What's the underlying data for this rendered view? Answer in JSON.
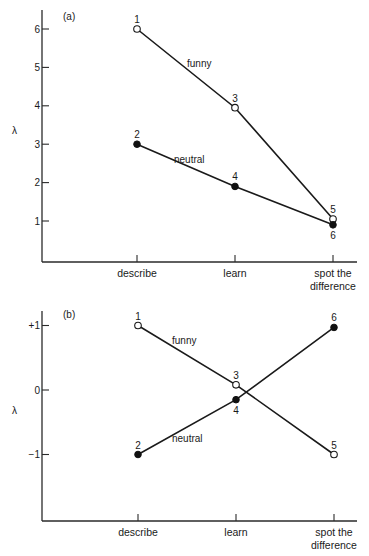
{
  "chart_data": [
    {
      "panel": "(a)",
      "type": "line",
      "xlabel": "",
      "ylabel": "λ",
      "categories": [
        "describe",
        "learn",
        "spot the difference"
      ],
      "category_lines": [
        [
          "describe"
        ],
        [
          "learn"
        ],
        [
          "spot the",
          "difference"
        ]
      ],
      "yticks": [
        1,
        2,
        3,
        4,
        5,
        6
      ],
      "ytick_labels": [
        "1",
        "2",
        "3",
        "4",
        "5",
        "6"
      ],
      "ylim": [
        0,
        6.5
      ],
      "grid": false,
      "series": [
        {
          "name": "funny",
          "marker": "open-circle",
          "values": [
            6.0,
            3.95,
            1.05
          ],
          "point_labels": [
            "1",
            "3",
            "5"
          ]
        },
        {
          "name": "neutral",
          "marker": "filled-circle",
          "values": [
            3.0,
            1.9,
            0.9
          ],
          "point_labels": [
            "2",
            "4",
            "6"
          ]
        }
      ]
    },
    {
      "panel": "(b)",
      "type": "line",
      "xlabel": "",
      "ylabel": "λ",
      "categories": [
        "describe",
        "learn",
        "spot the difference"
      ],
      "category_lines": [
        [
          "describe"
        ],
        [
          "learn"
        ],
        [
          "spot the",
          "difference"
        ]
      ],
      "yticks": [
        1,
        0,
        -1
      ],
      "ytick_labels": [
        "+1",
        "0",
        "−1"
      ],
      "ylim": [
        -2.0,
        1.25
      ],
      "grid": false,
      "series": [
        {
          "name": "funny",
          "marker": "open-circle",
          "values": [
            1.0,
            0.08,
            -1.0
          ],
          "point_labels": [
            "1",
            "3",
            "5"
          ]
        },
        {
          "name": "neutral",
          "marker": "filled-circle",
          "values": [
            -1.0,
            -0.15,
            0.97
          ],
          "point_labels": [
            "2",
            "4",
            "6"
          ]
        }
      ]
    }
  ]
}
